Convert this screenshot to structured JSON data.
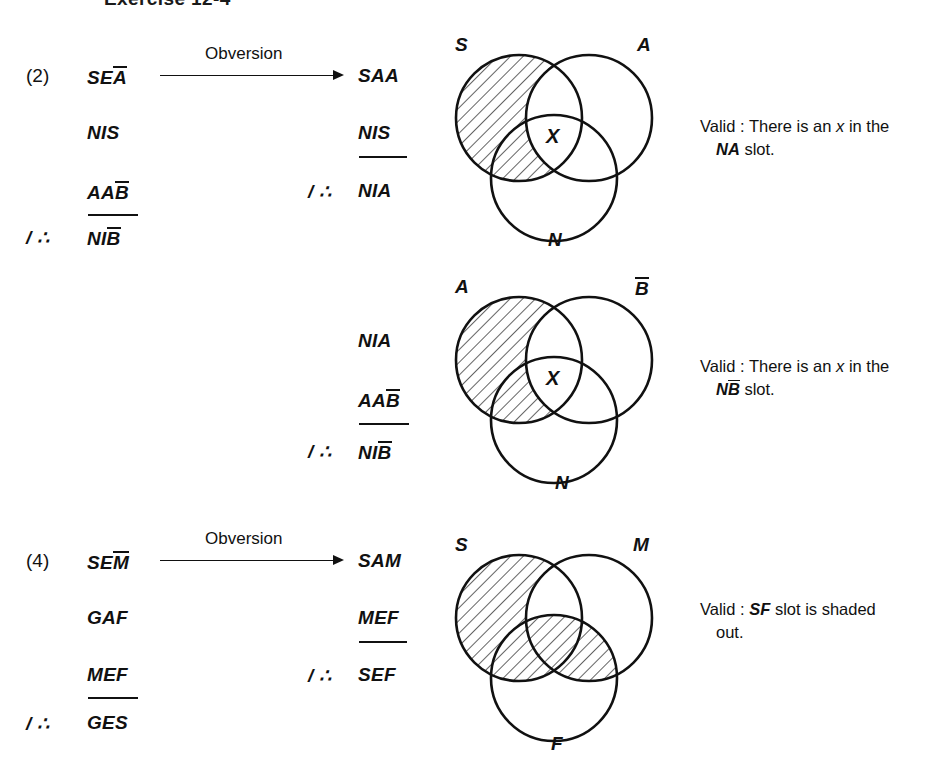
{
  "page": {
    "heading": "Exercise 12-4",
    "background": "#ffffff",
    "ink": "#111111"
  },
  "arrow": {
    "label": "Obversion"
  },
  "arguments": [
    {
      "index": "(2)",
      "left": {
        "premises": [
          "SEĀ",
          "NIS",
          "AAB̄"
        ],
        "therefore_symbol": "/ ∴",
        "conclusion": "NIB̄"
      },
      "right": {
        "premises": [
          "SAA",
          "NIS"
        ],
        "therefore_symbol": "/ ∴",
        "conclusion": "NIA"
      }
    },
    {
      "index": "",
      "left": {
        "premises": [],
        "therefore_symbol": "",
        "conclusion": ""
      },
      "right": {
        "premises": [
          "NIA",
          "AAB̄"
        ],
        "therefore_symbol": "/ ∴",
        "conclusion": "NIB̄"
      }
    },
    {
      "index": "(4)",
      "left": {
        "premises": [
          "SEM̄",
          "GAF",
          "MEF"
        ],
        "therefore_symbol": "/ ∴",
        "conclusion": "GES"
      },
      "right": {
        "premises": [
          "SAM",
          "MEF"
        ],
        "therefore_symbol": "/ ∴",
        "conclusion": "SEF"
      }
    }
  ],
  "diagrams": [
    {
      "id": "venn-1",
      "labels": {
        "left": "S",
        "right": "A",
        "bottom": "N"
      },
      "right_has_bar": false,
      "x_mark": "X",
      "x_region": "A∩N",
      "shaded_regions": [
        "S only",
        "S∩N"
      ]
    },
    {
      "id": "venn-2",
      "labels": {
        "left": "A",
        "right": "B",
        "bottom": "N"
      },
      "right_has_bar": true,
      "x_mark": "X",
      "x_region": "B̄∩N",
      "shaded_regions": [
        "A only",
        "A∩N"
      ]
    },
    {
      "id": "venn-3",
      "labels": {
        "left": "S",
        "right": "M",
        "bottom": "F"
      },
      "right_has_bar": false,
      "x_mark": "",
      "x_region": "",
      "shaded_regions": [
        "S only",
        "S∩F",
        "S∩M∩F",
        "M∩F"
      ]
    }
  ],
  "verdicts": [
    {
      "prefix": "Valid : There is an ",
      "variable": "x",
      "middle": " in the",
      "slot": "NA",
      "slot_has_bar": false,
      "suffix": " slot."
    },
    {
      "prefix": "Valid : There is an ",
      "variable": "x",
      "middle": " in the",
      "slot_first": "N",
      "slot_bar": "B",
      "slot_has_bar": true,
      "suffix": " slot."
    },
    {
      "prefix": "Valid : ",
      "slot": "SF",
      "slot_has_bar": false,
      "suffix": " slot is shaded",
      "second_line": "out."
    }
  ]
}
